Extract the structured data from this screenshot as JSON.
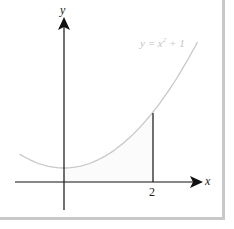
{
  "chart_data": {
    "type": "line",
    "title": "",
    "xlabel": "x",
    "ylabel": "y",
    "series": [
      {
        "name": "y = x² + 1",
        "function": "x^2+1",
        "x": [
          -1,
          -0.5,
          0,
          0.5,
          1,
          1.5,
          2,
          2.5,
          3
        ],
        "values": [
          2,
          1.25,
          1,
          1.25,
          2,
          3.25,
          5,
          7.25,
          10
        ]
      }
    ],
    "x_ticks": [
      "2"
    ],
    "annotations": [
      "y = x² + 1",
      "vertical line at x = 2",
      "shaded region under curve from x=0 to x=2"
    ],
    "xlim": [
      -1,
      3.3
    ],
    "ylim": [
      -1.3,
      11.5
    ],
    "grid": false,
    "colors": {
      "curve": "#c8c8c8",
      "axes": "#111111",
      "border": "#c8c8c8"
    }
  },
  "labels": {
    "x_axis": "x",
    "y_axis": "y",
    "tick_2": "2",
    "equation_y": "y",
    "equation_rest": " = x",
    "equation_exp": "2",
    "equation_tail": " + 1"
  }
}
